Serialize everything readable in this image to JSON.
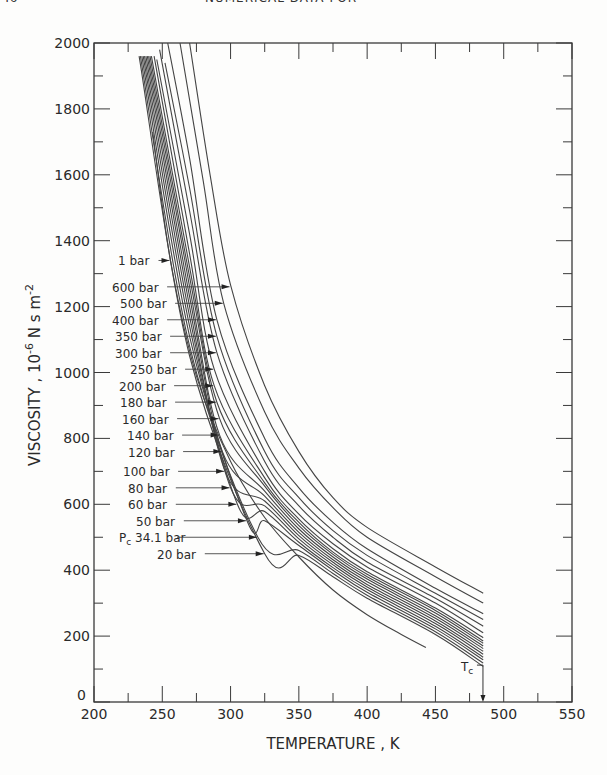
{
  "header": {
    "page_number": "46",
    "running_title": "NUMERICAL DATA FOR"
  },
  "chart_data": {
    "type": "line",
    "title": "",
    "xlabel": "TEMPERATURE , K",
    "ylabel": "VISCOSITY , 10^-6 N s m^-2",
    "xlim": [
      200,
      550
    ],
    "ylim": [
      0,
      2000
    ],
    "x_ticks": [
      200,
      250,
      300,
      350,
      400,
      450,
      500,
      550
    ],
    "y_ticks": [
      0,
      200,
      400,
      600,
      800,
      1000,
      1200,
      1400,
      1600,
      1800,
      2000
    ],
    "grid": false,
    "annotations": [
      {
        "text": "Tc",
        "x": 484.8,
        "note": "critical temperature arrow at x-axis"
      }
    ],
    "series": [
      {
        "name": "600 bar",
        "label_y": 1260,
        "arrow_x": 300,
        "points": [
          [
            270,
            2000
          ],
          [
            285,
            1600
          ],
          [
            300,
            1265
          ],
          [
            325,
            960
          ],
          [
            350,
            760
          ],
          [
            375,
            620
          ],
          [
            400,
            530
          ],
          [
            450,
            410
          ],
          [
            485,
            330
          ]
        ]
      },
      {
        "name": "500 bar",
        "label_y": 1210,
        "arrow_x": 295,
        "points": [
          [
            263,
            2000
          ],
          [
            280,
            1580
          ],
          [
            295,
            1210
          ],
          [
            325,
            880
          ],
          [
            350,
            710
          ],
          [
            375,
            590
          ],
          [
            400,
            500
          ],
          [
            450,
            380
          ],
          [
            485,
            300
          ]
        ]
      },
      {
        "name": "400 bar",
        "label_y": 1160,
        "arrow_x": 290,
        "points": [
          [
            254,
            2000
          ],
          [
            270,
            1650
          ],
          [
            290,
            1160
          ],
          [
            325,
            800
          ],
          [
            350,
            650
          ],
          [
            375,
            545
          ],
          [
            400,
            465
          ],
          [
            450,
            345
          ],
          [
            485,
            268
          ]
        ]
      },
      {
        "name": "350 bar",
        "label_y": 1110,
        "arrow_x": 290,
        "points": [
          [
            252,
            1940
          ],
          [
            270,
            1560
          ],
          [
            290,
            1110
          ],
          [
            325,
            760
          ],
          [
            350,
            620
          ],
          [
            375,
            520
          ],
          [
            400,
            445
          ],
          [
            450,
            330
          ],
          [
            485,
            250
          ]
        ]
      },
      {
        "name": "300 bar",
        "label_y": 1060,
        "arrow_x": 290,
        "points": [
          [
            248,
            1980
          ],
          [
            270,
            1490
          ],
          [
            290,
            1060
          ],
          [
            325,
            730
          ],
          [
            350,
            595
          ],
          [
            375,
            500
          ],
          [
            400,
            425
          ],
          [
            450,
            315
          ],
          [
            485,
            230
          ]
        ]
      },
      {
        "name": "250 bar",
        "label_y": 1010,
        "arrow_x": 288,
        "points": [
          [
            246,
            1950
          ],
          [
            270,
            1420
          ],
          [
            288,
            1010
          ],
          [
            325,
            700
          ],
          [
            350,
            570
          ],
          [
            375,
            480
          ],
          [
            400,
            410
          ],
          [
            450,
            300
          ],
          [
            485,
            210
          ]
        ]
      },
      {
        "name": "200 bar",
        "label_y": 960,
        "arrow_x": 288,
        "points": [
          [
            244,
            1960
          ],
          [
            270,
            1360
          ],
          [
            288,
            960
          ],
          [
            325,
            680
          ],
          [
            350,
            555
          ],
          [
            375,
            465
          ],
          [
            400,
            395
          ],
          [
            450,
            285
          ],
          [
            485,
            195
          ]
        ]
      },
      {
        "name": "180 bar",
        "label_y": 910,
        "arrow_x": 290,
        "points": [
          [
            242,
            1960
          ],
          [
            270,
            1320
          ],
          [
            290,
            910
          ],
          [
            325,
            665
          ],
          [
            350,
            545
          ],
          [
            375,
            455
          ],
          [
            400,
            388
          ],
          [
            450,
            278
          ],
          [
            485,
            185
          ]
        ]
      },
      {
        "name": "160 bar",
        "label_y": 860,
        "arrow_x": 292,
        "points": [
          [
            241,
            1960
          ],
          [
            270,
            1290
          ],
          [
            292,
            860
          ],
          [
            325,
            655
          ],
          [
            350,
            535
          ],
          [
            375,
            448
          ],
          [
            400,
            380
          ],
          [
            450,
            270
          ],
          [
            485,
            178
          ]
        ]
      },
      {
        "name": "140 bar",
        "label_y": 810,
        "arrow_x": 292,
        "points": [
          [
            240,
            1960
          ],
          [
            270,
            1260
          ],
          [
            292,
            810
          ],
          [
            325,
            640
          ],
          [
            350,
            525
          ],
          [
            375,
            440
          ],
          [
            400,
            373
          ],
          [
            450,
            262
          ],
          [
            485,
            170
          ]
        ]
      },
      {
        "name": "120 bar",
        "label_y": 760,
        "arrow_x": 294,
        "points": [
          [
            239,
            1960
          ],
          [
            270,
            1230
          ],
          [
            294,
            760
          ],
          [
            325,
            625
          ],
          [
            350,
            515
          ],
          [
            375,
            432
          ],
          [
            400,
            365
          ],
          [
            450,
            254
          ],
          [
            485,
            162
          ]
        ]
      },
      {
        "name": "100 bar",
        "label_y": 700,
        "arrow_x": 296,
        "points": [
          [
            238,
            1960
          ],
          [
            270,
            1200
          ],
          [
            296,
            700
          ],
          [
            325,
            610
          ],
          [
            350,
            505
          ],
          [
            375,
            424
          ],
          [
            400,
            357
          ],
          [
            450,
            246
          ],
          [
            485,
            154
          ]
        ]
      },
      {
        "name": "80 bar",
        "label_y": 650,
        "arrow_x": 300,
        "points": [
          [
            237,
            1960
          ],
          [
            270,
            1170
          ],
          [
            300,
            650
          ],
          [
            325,
            595
          ],
          [
            350,
            495
          ],
          [
            375,
            416
          ],
          [
            400,
            349
          ],
          [
            450,
            238
          ],
          [
            485,
            145
          ]
        ]
      },
      {
        "name": "60 bar",
        "label_y": 600,
        "arrow_x": 305,
        "points": [
          [
            236,
            1960
          ],
          [
            270,
            1140
          ],
          [
            305,
            600
          ],
          [
            325,
            578
          ],
          [
            350,
            485
          ],
          [
            375,
            408
          ],
          [
            400,
            341
          ],
          [
            450,
            230
          ],
          [
            485,
            136
          ]
        ]
      },
      {
        "name": "50 bar",
        "label_y": 550,
        "arrow_x": 312,
        "points": [
          [
            235,
            1960
          ],
          [
            270,
            1110
          ],
          [
            312,
            550
          ],
          [
            325,
            550
          ],
          [
            350,
            475
          ],
          [
            375,
            400
          ],
          [
            400,
            333
          ],
          [
            450,
            222
          ],
          [
            485,
            128
          ]
        ]
      },
      {
        "name": "Pc 34.1 bar",
        "label_y": 500,
        "arrow_x": 320,
        "points": [
          [
            234,
            1960
          ],
          [
            270,
            1080
          ],
          [
            320,
            500
          ],
          [
            350,
            460
          ],
          [
            375,
            390
          ],
          [
            400,
            324
          ],
          [
            450,
            213
          ],
          [
            485,
            118
          ]
        ]
      },
      {
        "name": "20 bar",
        "label_y": 450,
        "arrow_x": 325,
        "points": [
          [
            233,
            1960
          ],
          [
            270,
            1050
          ],
          [
            325,
            450
          ],
          [
            350,
            445
          ],
          [
            375,
            380
          ],
          [
            400,
            315
          ],
          [
            450,
            205
          ],
          [
            485,
            108
          ]
        ]
      },
      {
        "name": "1 bar",
        "label_y": 1340,
        "arrow_x": 256,
        "points": [
          [
            243,
            1730
          ],
          [
            256,
            1340
          ],
          [
            275,
            990
          ],
          [
            300,
            730
          ],
          [
            325,
            560
          ],
          [
            350,
            440
          ],
          [
            375,
            340
          ],
          [
            400,
            265
          ],
          [
            425,
            205
          ],
          [
            443,
            165
          ]
        ]
      }
    ]
  }
}
